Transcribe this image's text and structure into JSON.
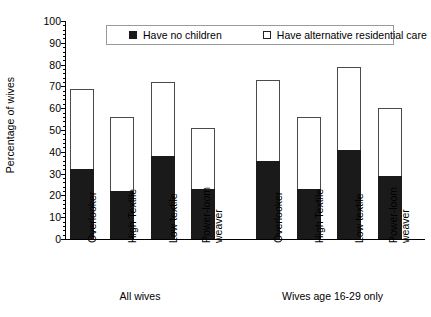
{
  "chart_data": {
    "type": "bar",
    "stacked": true,
    "title": "",
    "xlabel": "",
    "ylabel": "Percentage of wives",
    "ylim": [
      0,
      100
    ],
    "ytick_step": 10,
    "yticks": [
      0,
      10,
      20,
      30,
      40,
      50,
      60,
      70,
      80,
      90,
      100
    ],
    "grid": false,
    "legend_position": "top-center",
    "legend": [
      "Have no children",
      "Have alternative residential care"
    ],
    "series": [
      {
        "name": "Have no children",
        "color": "#1a1a1a",
        "values": [
          32,
          22,
          38,
          23,
          36,
          23,
          41,
          29
        ]
      },
      {
        "name": "Have alternative residential care",
        "color": "#ffffff",
        "values": [
          37,
          34,
          34,
          28,
          37,
          33,
          38,
          31
        ]
      }
    ],
    "totals": [
      69,
      56,
      72,
      51,
      73,
      56,
      79,
      60
    ],
    "categories": [
      "Overlooker",
      "High Textile",
      "Low textile",
      "Power-loom weaver",
      "Overlooker",
      "High Textile",
      "Low textile",
      "Power-loom weaver"
    ],
    "groups": [
      {
        "label": "All wives",
        "categories": [
          "Overlooker",
          "High Textile",
          "Low textile",
          "Power-loom weaver"
        ]
      },
      {
        "label": "Wives age 16-29 only",
        "categories": [
          "Overlooker",
          "High Textile",
          "Low textile",
          "Power-loom weaver"
        ]
      }
    ]
  },
  "axis": {
    "y_title": "Percentage of wives",
    "y_labels": [
      "100",
      "90",
      "80",
      "70",
      "60",
      "50",
      "40",
      "30",
      "20",
      "10",
      "0"
    ]
  },
  "legend": {
    "item1": "Have no children",
    "item2": "Have alternative residential care"
  },
  "categories": {
    "c0_line1": "Overlooker",
    "c0_line2": "",
    "c1_line1": "High Textile",
    "c1_line2": "",
    "c2_line1": "Low textile",
    "c2_line2": "",
    "c3_line1": "Power-loom",
    "c3_line2": "weaver",
    "c4_line1": "Overlooker",
    "c4_line2": "",
    "c5_line1": "High Textile",
    "c5_line2": "",
    "c6_line1": "Low textile",
    "c6_line2": "",
    "c7_line1": "Power-loom",
    "c7_line2": "weaver"
  },
  "groups": {
    "g0": "All wives",
    "g1": "Wives age 16-29 only"
  }
}
